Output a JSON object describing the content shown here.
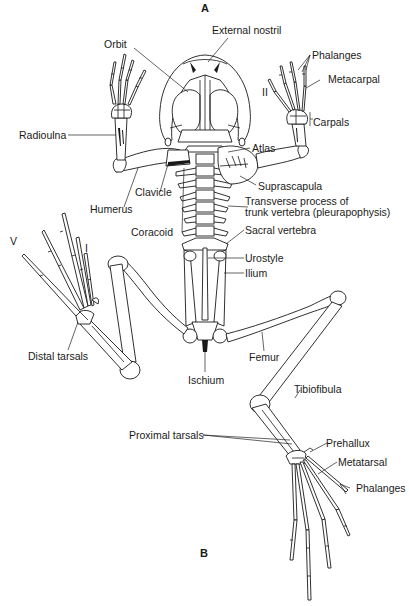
{
  "figure": {
    "panels": {
      "top": "A",
      "bottom": "B"
    },
    "digit_numerals": {
      "forelimb_right": "II",
      "hindlimb_left_outer": "V",
      "hindlimb_left_inner": "I"
    }
  },
  "labels": {
    "external_nostril": "External nostril",
    "orbit": "Orbit",
    "phalanges_fore": "Phalanges",
    "metacarpal": "Metacarpal",
    "carpals": "Carpals",
    "radioulna": "Radioulna",
    "atlas": "Atlas",
    "suprascapula": "Suprascapula",
    "clavicle": "Clavicle",
    "humerus": "Humerus",
    "transverse_process_line1": "Transverse process of",
    "transverse_process_line2": "trunk vertebra (pleurapophysis)",
    "coracoid": "Coracoid",
    "sacral_vertebra": "Sacral vertebra",
    "urostyle": "Urostyle",
    "ilium": "Ilium",
    "distal_tarsals": "Distal tarsals",
    "femur": "Femur",
    "ischium": "Ischium",
    "tibiofibula": "Tibiofibula",
    "proximal_tarsals": "Proximal tarsals",
    "prehallux": "Prehallux",
    "metatarsal": "Metatarsal",
    "phalanges_hind": "Phalanges"
  },
  "colors": {
    "ink": "#1a1a1a",
    "background": "#ffffff"
  }
}
